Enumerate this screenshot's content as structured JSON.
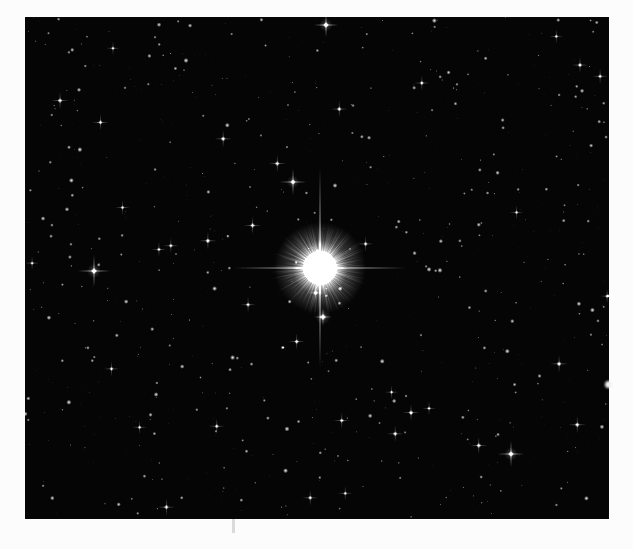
{
  "image": {
    "kind": "astronomical-photograph",
    "subject": "bright-star-field",
    "caption": "",
    "border_color": "#fcfcfc",
    "sky_color": "#050505",
    "star_color": "#ffffff",
    "plate": {
      "x": 25,
      "y": 17,
      "width": 584,
      "height": 502
    }
  },
  "chart_data": {
    "type": "scatter",
    "title": "",
    "xlabel": "",
    "ylabel": "",
    "grid": false,
    "legend": null,
    "xlim": [
      0,
      584
    ],
    "ylim": [
      0,
      502
    ],
    "note": "Star field plate: positions in plate-relative pixels, magnitude proxy = rendered radius / brightness",
    "primary_star": {
      "name": "main-star",
      "x": 295,
      "y": 251,
      "core_radius": 17,
      "halo_radius": 46,
      "spike_vertical_half_length": 100,
      "spike_horizontal_half_length": 86,
      "brightness": 1.0
    },
    "secondary_stars": [
      {
        "name": "star-left-spiked",
        "x": 69,
        "y": 254,
        "radius": 3.2,
        "spike": 16,
        "brightness": 0.92
      },
      {
        "name": "star-upper-spiked",
        "x": 268,
        "y": 165,
        "radius": 2.8,
        "spike": 13,
        "brightness": 0.9
      },
      {
        "name": "star-top-bright",
        "x": 301,
        "y": 8,
        "radius": 3.0,
        "spike": 12,
        "brightness": 0.95
      },
      {
        "name": "star-lower-right-spiked",
        "x": 486,
        "y": 437,
        "radius": 3.0,
        "spike": 13,
        "brightness": 0.9
      },
      {
        "name": "star-below-core",
        "x": 298,
        "y": 300,
        "radius": 3.4,
        "spike": 9,
        "brightness": 0.88
      }
    ],
    "field_stars_count": 900,
    "field_star_radius_range": [
      0.4,
      2.6
    ],
    "field_star_brightness_range": [
      0.12,
      0.95
    ]
  },
  "annotations": {
    "edge_notch_right": {
      "x": 605,
      "y": 381,
      "label": "plate-edge-notch"
    },
    "edge_mark_bottom": {
      "x": 232,
      "y": 519,
      "label": "plate-edge-mark"
    }
  }
}
